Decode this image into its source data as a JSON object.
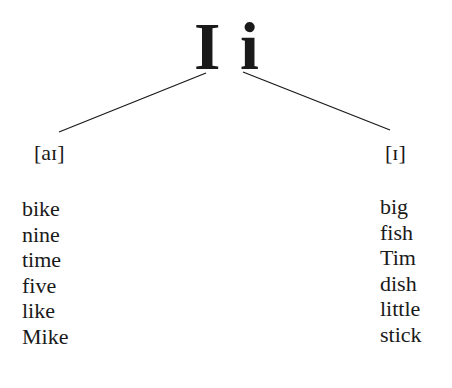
{
  "header": {
    "uppercase_letter": "I",
    "lowercase_letter": "i"
  },
  "branches": {
    "left": {
      "ipa": "[aɪ]",
      "words": [
        "bike",
        "nine",
        "time",
        "five",
        "like",
        "Mike"
      ]
    },
    "right": {
      "ipa": "[ɪ]",
      "words": [
        "big",
        "fish",
        "Tim",
        "dish",
        "little",
        "stick"
      ]
    }
  },
  "colors": {
    "text": "#1a1a1a",
    "background": "#ffffff"
  }
}
